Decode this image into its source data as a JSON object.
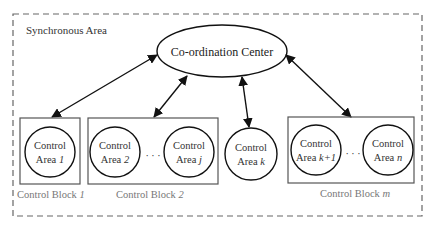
{
  "diagram": {
    "outer_label": "Synchronous Area",
    "center_label": "Co-ordination Center",
    "areas": {
      "a1": {
        "line1": "Control",
        "line2_prefix": "Area ",
        "line2_var": "1"
      },
      "a2": {
        "line1": "Control",
        "line2_prefix": "Area ",
        "line2_var": "2"
      },
      "aj": {
        "line1": "Control",
        "line2_prefix": "Area ",
        "line2_var": "j"
      },
      "ak": {
        "line1": "Control",
        "line2_prefix": "Area ",
        "line2_var": "k"
      },
      "ak1": {
        "line1": "Control",
        "line2_prefix": "Area ",
        "line2_var": "k+1"
      },
      "an": {
        "line1": "Control",
        "line2_prefix": "Area ",
        "line2_var": "n"
      }
    },
    "blocks": {
      "b1": {
        "prefix": "Control Block ",
        "var": "1"
      },
      "b2": {
        "prefix": "Control Block ",
        "var": "2"
      },
      "bm": {
        "prefix": "Control Block ",
        "var": "m"
      }
    },
    "ellipsis": "· · ·",
    "colors": {
      "line": "#111111",
      "box": "#555555",
      "dash": "#666666",
      "block_label": "#777777"
    }
  }
}
